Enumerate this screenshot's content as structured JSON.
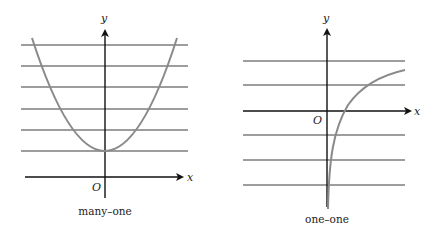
{
  "figures": [
    {
      "id": "left",
      "caption": "many–one",
      "x_label": "x",
      "y_label": "y",
      "origin_label": "O",
      "curve": "parabola (U-shaped), minimum on y-axis",
      "horizontal_lines": 6
    },
    {
      "id": "right",
      "caption": "one–one",
      "x_label": "x",
      "y_label": "y",
      "origin_label": "O",
      "curve": "logarithmic-type increasing curve",
      "horizontal_lines": 5
    }
  ],
  "colors": {
    "axis": "#111111",
    "curve": "#8a8a8a",
    "lines": "#7d7d7d"
  }
}
